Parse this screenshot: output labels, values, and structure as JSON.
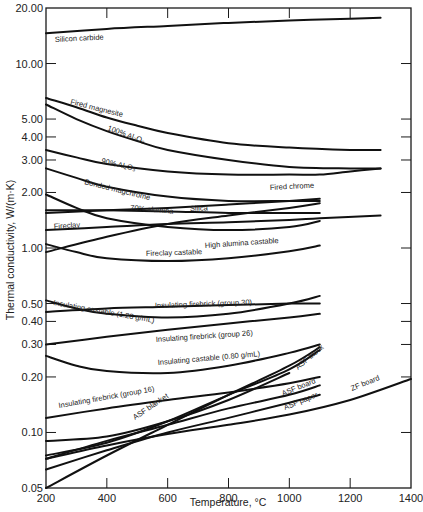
{
  "chart_data": {
    "type": "line",
    "title": "",
    "xlabel": "Temperature, °C",
    "ylabel": "Thermal conductivity, W/(m·K)",
    "xscale": "linear",
    "yscale": "log",
    "xlim": [
      200,
      1400
    ],
    "ylim": [
      0.05,
      20.0
    ],
    "grid": false,
    "legend": "inline labels",
    "x_ticks": [
      200,
      400,
      600,
      800,
      1000,
      1200,
      1400
    ],
    "x_tick_labels": [
      "200",
      "400",
      "600",
      "800",
      "1000",
      "1200",
      "1400"
    ],
    "y_ticks": [
      20.0,
      10.0,
      5.0,
      4.0,
      3.0,
      2.0,
      1.0,
      0.5,
      0.4,
      0.3,
      0.2,
      0.1,
      0.05
    ],
    "y_tick_labels": [
      "20.00",
      "10.00",
      "5.00",
      "4.00",
      "3.00",
      "2.00",
      "1.00",
      "0.50",
      "0.40",
      "0.30",
      "0.20",
      "0.10",
      "0.05"
    ],
    "series": [
      {
        "name": "Silicon carbide",
        "x": [
          200,
          400,
          600,
          800,
          1000,
          1200,
          1300
        ],
        "values": [
          14.6,
          15.4,
          16.0,
          16.6,
          17.1,
          17.5,
          17.7
        ],
        "label_pos": [
          55,
          42,
          -3
        ]
      },
      {
        "name": "Fired magnesite",
        "x": [
          200,
          300,
          400,
          500,
          600,
          800,
          1000,
          1200,
          1300
        ],
        "values": [
          6.5,
          5.8,
          5.1,
          4.6,
          4.2,
          3.7,
          3.5,
          3.4,
          3.4
        ],
        "label_pos": [
          70,
          104,
          14
        ]
      },
      {
        "name": "100% Al₂O₃",
        "x": [
          200,
          300,
          400,
          500,
          600,
          800,
          1000,
          1200,
          1300
        ],
        "values": [
          6.0,
          5.0,
          4.3,
          3.8,
          3.4,
          3.0,
          2.75,
          2.7,
          2.7
        ],
        "label_pos": [
          107,
          130,
          20
        ]
      },
      {
        "name": "90% Al₂O₃",
        "x": [
          200,
          300,
          400,
          600,
          800,
          1000,
          1100,
          1200,
          1300
        ],
        "values": [
          3.4,
          3.1,
          2.85,
          2.6,
          2.5,
          2.5,
          2.5,
          2.6,
          2.7
        ],
        "label_pos": [
          101,
          163,
          13
        ]
      },
      {
        "name": "Bonded magchrome",
        "x": [
          200,
          300,
          400,
          600,
          800,
          1000,
          1100
        ],
        "values": [
          2.7,
          2.4,
          2.15,
          1.9,
          1.8,
          1.8,
          1.8
        ],
        "label_pos": [
          84,
          184,
          14
        ]
      },
      {
        "name": "Fired chrome",
        "x": [
          200,
          400,
          600,
          800,
          1000,
          1100
        ],
        "values": [
          1.55,
          1.6,
          1.65,
          1.72,
          1.8,
          1.85
        ],
        "label_pos": [
          270,
          190,
          -3
        ]
      },
      {
        "name": "70% alumina",
        "x": [
          200,
          400,
          600,
          800,
          1000,
          1100
        ],
        "values": [
          1.6,
          1.6,
          1.58,
          1.55,
          1.55,
          1.55
        ],
        "label_pos": [
          130,
          210,
          5
        ]
      },
      {
        "name": "Silica",
        "x": [
          200,
          400,
          600,
          800,
          1000,
          1100
        ],
        "values": [
          0.95,
          1.15,
          1.35,
          1.5,
          1.65,
          1.75
        ],
        "label_pos": [
          190,
          211,
          -2
        ]
      },
      {
        "name": "Fireclay",
        "x": [
          200,
          400,
          600,
          800,
          1000,
          1100,
          1300
        ],
        "values": [
          1.25,
          1.3,
          1.35,
          1.38,
          1.42,
          1.45,
          1.5
        ],
        "label_pos": [
          54,
          229,
          -4
        ]
      },
      {
        "name": "High alumina castable",
        "x": [
          200,
          300,
          400,
          600,
          800,
          1000,
          1100
        ],
        "values": [
          1.95,
          1.65,
          1.45,
          1.3,
          1.25,
          1.3,
          1.4
        ],
        "label_pos": [
          205,
          248,
          -4
        ]
      },
      {
        "name": "Fireclay castable",
        "x": [
          200,
          300,
          400,
          600,
          800,
          1000,
          1100
        ],
        "values": [
          1.05,
          0.95,
          0.88,
          0.85,
          0.88,
          0.96,
          1.03
        ],
        "label_pos": [
          146,
          256,
          -2
        ]
      },
      {
        "name": "Insulating firebrick (group 30)",
        "x": [
          200,
          400,
          600,
          800,
          1000,
          1100
        ],
        "values": [
          0.45,
          0.47,
          0.48,
          0.49,
          0.5,
          0.5
        ],
        "label_pos": [
          155,
          308,
          -2
        ]
      },
      {
        "name": "Insulating castable (1.28 g/mL)",
        "x": [
          200,
          300,
          400,
          600,
          800,
          1000,
          1100
        ],
        "values": [
          0.52,
          0.47,
          0.44,
          0.42,
          0.44,
          0.5,
          0.55
        ],
        "label_pos": [
          53,
          305,
          10
        ]
      },
      {
        "name": "Insulating firebrick (group 26)",
        "x": [
          200,
          400,
          600,
          800,
          1000,
          1100
        ],
        "values": [
          0.3,
          0.33,
          0.36,
          0.39,
          0.42,
          0.44
        ],
        "label_pos": [
          156,
          342,
          -4
        ]
      },
      {
        "name": "Insulating castable (0.80 g/mL)",
        "x": [
          200,
          300,
          400,
          600,
          800,
          1000,
          1100
        ],
        "values": [
          0.26,
          0.23,
          0.215,
          0.21,
          0.23,
          0.27,
          0.3
        ],
        "label_pos": [
          158,
          365,
          -5
        ]
      },
      {
        "name": "Insulating firebrick (group 16)",
        "x": [
          200,
          400,
          600,
          800,
          1000,
          1100
        ],
        "values": [
          0.12,
          0.135,
          0.15,
          0.165,
          0.185,
          0.2
        ],
        "label_pos": [
          59,
          408,
          -10
        ]
      },
      {
        "name": "ASF blanket",
        "x": [
          200,
          400,
          600,
          800,
          1000,
          1100
        ],
        "values": [
          0.05,
          0.075,
          0.11,
          0.16,
          0.23,
          0.29
        ],
        "label_pos": [
          135,
          420,
          -34
        ]
      },
      {
        "name": "ASF block",
        "x": [
          200,
          400,
          600,
          800,
          1000,
          1100
        ],
        "values": [
          0.075,
          0.088,
          0.115,
          0.16,
          0.22,
          0.28
        ],
        "label_pos": [
          298,
          370,
          -40
        ]
      },
      {
        "name": "ASF board",
        "x": [
          200,
          400,
          600,
          800,
          1000
        ],
        "values": [
          0.09,
          0.095,
          0.115,
          0.15,
          0.21
        ],
        "label_pos": [
          283,
          396,
          -22
        ]
      },
      {
        "name": "ASF paper",
        "x": [
          200,
          400,
          600,
          800,
          1000,
          1100
        ],
        "values": [
          0.072,
          0.09,
          0.11,
          0.135,
          0.16,
          0.18
        ],
        "label_pos": [
          285,
          410,
          -22
        ]
      },
      {
        "name": "ASF board (lower)",
        "x": [
          200,
          400,
          600,
          800,
          1000,
          1100
        ],
        "values": [
          0.063,
          0.08,
          0.1,
          0.12,
          0.145,
          0.16
        ],
        "label_pos": null
      },
      {
        "name": "ZF board",
        "x": [
          200,
          400,
          600,
          800,
          1000,
          1200,
          1400
        ],
        "values": [
          0.072,
          0.085,
          0.098,
          0.11,
          0.125,
          0.15,
          0.195
        ],
        "label_pos": [
          352,
          391,
          -22
        ]
      }
    ]
  },
  "axes": {
    "xlabel": "Temperature, °C",
    "ylabel": "Thermal conductivity, W/(m·K)"
  }
}
